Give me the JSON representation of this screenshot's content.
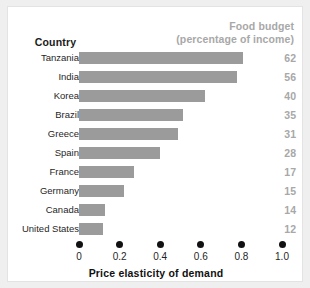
{
  "figure": {
    "column_header_left": "Country",
    "column_header_right_line1": "Food budget",
    "column_header_right_line2": "(percentage of income)",
    "axis_title": "Price elasticity of demand",
    "bar_color": "#9b9b9b",
    "value_color": "#a8a8a8",
    "tick_color": "#111111"
  },
  "chart_data": {
    "type": "bar",
    "orientation": "horizontal",
    "title": "",
    "xlabel": "Price elasticity of demand",
    "ylabel": "Country",
    "xlim": [
      0,
      1.0
    ],
    "xticks": [
      "0",
      "0.2",
      "0.4",
      "0.6",
      "0.8",
      "1.0"
    ],
    "xtick_values": [
      0,
      0.2,
      0.4,
      0.6,
      0.8,
      1.0
    ],
    "grid": false,
    "legend": "none",
    "categories": [
      "Tanzania",
      "India",
      "Korea",
      "Brazil",
      "Greece",
      "Spain",
      "France",
      "Germany",
      "Canada",
      "United States"
    ],
    "values": [
      0.81,
      0.78,
      0.62,
      0.51,
      0.49,
      0.4,
      0.27,
      0.22,
      0.13,
      0.12
    ],
    "series": [
      {
        "name": "Price elasticity of demand",
        "values": [
          0.81,
          0.78,
          0.62,
          0.51,
          0.49,
          0.4,
          0.27,
          0.22,
          0.13,
          0.12
        ]
      }
    ],
    "annotations": {
      "label": "Food budget (percentage of income)",
      "values": [
        62,
        56,
        40,
        35,
        31,
        28,
        17,
        15,
        14,
        12
      ]
    }
  }
}
